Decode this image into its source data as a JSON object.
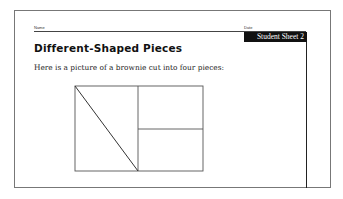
{
  "header": {
    "name_label": "Name",
    "date_label": "Date",
    "sheet_badge": "Student Sheet 2"
  },
  "main": {
    "title": "Different-Shaped Pieces",
    "intro": "Here is a picture of a brownie cut into four pieces:"
  },
  "figure": {
    "piece_count": 4
  }
}
